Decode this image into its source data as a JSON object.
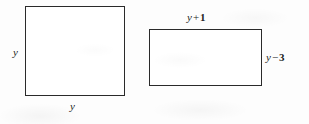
{
  "figure": {
    "name": "geometry-figure-two-quadrilaterals",
    "background_color": "#fdfdfd",
    "stroke_color": "#2a2a2a",
    "fill_color": "#ffffff",
    "text_color": "#1d1d1d"
  },
  "square": {
    "name": "square",
    "left_label": {
      "variable": "y",
      "operator": "",
      "number": ""
    },
    "bottom_label": {
      "variable": "y",
      "operator": "",
      "number": ""
    }
  },
  "rectangle": {
    "name": "rectangle",
    "top_label": {
      "variable": "y",
      "operator": "+",
      "number": "1"
    },
    "right_label": {
      "variable": "y",
      "operator": "−",
      "number": "3"
    }
  }
}
